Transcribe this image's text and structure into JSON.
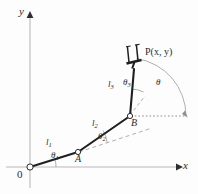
{
  "figure": {
    "type": "diagram",
    "background": "#fdfdfd",
    "ink_color": "#2b2b2b",
    "guide_color": "#9a9a9a"
  },
  "axes": {
    "x_label": "x",
    "y_label": "y",
    "origin_label": "0",
    "x_axis": {
      "x1": 6,
      "y1": 167,
      "x2": 178,
      "y2": 167
    },
    "y_axis": {
      "x1": 30,
      "y1": 188,
      "x2": 30,
      "y2": 14
    },
    "x_label_pos": {
      "x": 183,
      "y": 161
    },
    "y_label_pos": {
      "x": 20,
      "y": 9
    },
    "origin_label_pos": {
      "x": 18,
      "y": 170
    }
  },
  "joints": [
    {
      "name": "O",
      "label": "0",
      "x": 30,
      "y": 167
    },
    {
      "name": "A",
      "label": "A",
      "x": 78,
      "y": 152,
      "label_pos": {
        "x": 76,
        "y": 154
      }
    },
    {
      "name": "B",
      "label": "B",
      "x": 130,
      "y": 116,
      "label_pos": {
        "x": 130,
        "y": 118
      }
    },
    {
      "name": "P",
      "label": "P",
      "x": 133,
      "y": 68
    }
  ],
  "links": [
    {
      "name": "link1",
      "label": "l",
      "subscript": "1",
      "from": "O",
      "to": "A",
      "label_pos": {
        "x": 47,
        "y": 142
      }
    },
    {
      "name": "link2",
      "label": "l",
      "subscript": "2",
      "from": "A",
      "to": "B",
      "label_pos": {
        "x": 93,
        "y": 123
      }
    },
    {
      "name": "link3",
      "label": "l",
      "subscript": "3",
      "from": "B",
      "to": "P",
      "label_pos": {
        "x": 110,
        "y": 84
      }
    }
  ],
  "angles": [
    {
      "name": "theta1",
      "label": "θ",
      "subscript": "1",
      "label_pos": {
        "x": 52,
        "y": 155
      },
      "measured_from": "x-axis",
      "at_joint": "O"
    },
    {
      "name": "theta2",
      "label": "θ",
      "subscript": "2",
      "label_pos": {
        "x": 99,
        "y": 137
      },
      "measured_from": "link1-extension",
      "at_joint": "A"
    },
    {
      "name": "theta3",
      "label": "θ",
      "subscript": "3",
      "label_pos": {
        "x": 124,
        "y": 82
      },
      "measured_from": "link2-extension",
      "at_joint": "B"
    },
    {
      "name": "theta",
      "label": "θ",
      "subscript": "",
      "label_pos": {
        "x": 156,
        "y": 82
      },
      "measured_from": "horizontal",
      "at_joint": "B"
    }
  ],
  "end_effector": {
    "name": "gripper",
    "point_label": "P(x, y)",
    "point_label_pos": {
      "x": 145,
      "y": 51
    },
    "x": 133,
    "y": 68,
    "prong_count": 2
  },
  "guides": [
    {
      "name": "horizontal-dotted-from-B",
      "style": "dotted",
      "from": {
        "x": 130,
        "y": 116
      },
      "to": {
        "x": 186,
        "y": 116
      }
    },
    {
      "name": "link1-extension-dashed",
      "style": "dashed",
      "from": {
        "x": 78,
        "y": 152
      },
      "to": {
        "x": 150,
        "y": 129
      }
    },
    {
      "name": "link2-extension-dashed",
      "style": "dashed",
      "from": {
        "x": 130,
        "y": 116
      },
      "to": {
        "x": 144,
        "y": 98
      }
    }
  ],
  "arcs": [
    {
      "name": "arc-theta1",
      "at": "O",
      "radius": 26
    },
    {
      "name": "arc-theta2",
      "at": "A",
      "radius": 30
    },
    {
      "name": "arc-theta3",
      "at": "B",
      "radius": 27
    },
    {
      "name": "arc-theta",
      "at": "B",
      "radius": 58
    }
  ]
}
